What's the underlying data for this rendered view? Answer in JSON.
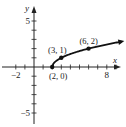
{
  "chart_data": {
    "type": "line",
    "title": "",
    "xlabel": "x",
    "ylabel": "y",
    "xlim": [
      -3,
      10
    ],
    "ylim": [
      -6,
      6
    ],
    "x_ticks": [
      -2,
      -1,
      1,
      2,
      3,
      4,
      5,
      6,
      7,
      8,
      9
    ],
    "y_ticks": [
      -5,
      -4,
      -3,
      -2,
      -1,
      1,
      2,
      3,
      4,
      5
    ],
    "x_tick_labels": [
      {
        "value": -2,
        "label": "−2"
      },
      {
        "value": 8,
        "label": "8"
      }
    ],
    "y_tick_labels": [
      {
        "value": 5,
        "label": "5"
      },
      {
        "value": -5,
        "label": "−5"
      }
    ],
    "function": "y = sqrt(x - 2)",
    "curve_domain": [
      2,
      9.6
    ],
    "series": [
      {
        "name": "y = sqrt(x-2)",
        "x": [
          2,
          3,
          6
        ],
        "y": [
          0,
          1,
          2
        ]
      }
    ],
    "points": [
      {
        "x": 2,
        "y": 0,
        "label": "(2, 0)",
        "label_pos": "below"
      },
      {
        "x": 3,
        "y": 1,
        "label": "(3, 1)",
        "label_pos": "above-left"
      },
      {
        "x": 6,
        "y": 2,
        "label": "(6, 2)",
        "label_pos": "above"
      }
    ],
    "grid": false,
    "legend": "none"
  }
}
